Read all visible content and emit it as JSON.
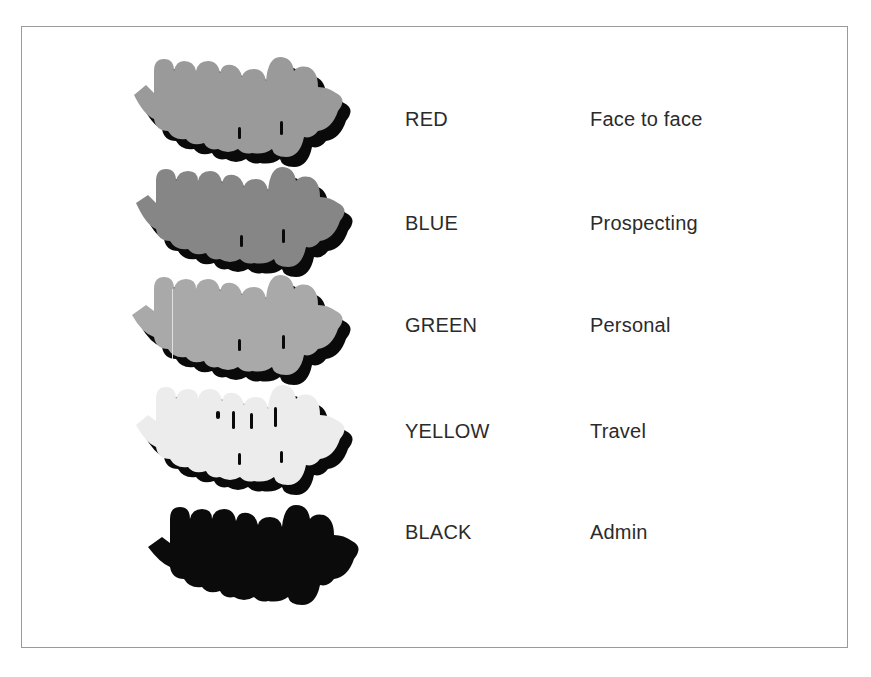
{
  "legend": {
    "rows": [
      {
        "color_name": "RED",
        "category": "Face to face",
        "fill": "#9a9a9a"
      },
      {
        "color_name": "BLUE",
        "category": "Prospecting",
        "fill": "#868686"
      },
      {
        "color_name": "GREEN",
        "category": "Personal",
        "fill": "#a9a9a9"
      },
      {
        "color_name": "YELLOW",
        "category": "Travel",
        "fill": "#ececec"
      },
      {
        "color_name": "BLACK",
        "category": "Admin",
        "fill": "#0b0b0b"
      }
    ],
    "shadow_color": "#0a0a0a",
    "text_color": "#2b2b2b",
    "border_color": "#9a9a9a"
  }
}
